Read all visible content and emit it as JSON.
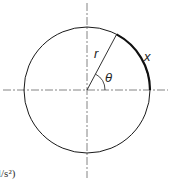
{
  "diagram": {
    "labels": {
      "radius": "r",
      "angle": "θ",
      "arc_length": "x"
    },
    "caption_fragment": "l/s²)",
    "colors": {
      "stroke": "#1a1a1a",
      "axis": "#555555",
      "background": "#ffffff"
    },
    "geometry": {
      "center": [
        87,
        90
      ],
      "radius": 63,
      "theta_deg": 62
    }
  }
}
